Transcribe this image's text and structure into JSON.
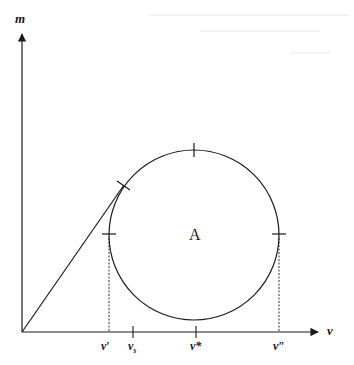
{
  "figure": {
    "colors": {
      "ink": "#1a1a1a",
      "background": "#ffffff"
    },
    "axes": {
      "y_label": "m",
      "x_label": "ν",
      "origin": [
        22,
        332
      ],
      "y_end": [
        22,
        32
      ],
      "x_end": [
        320,
        332
      ]
    },
    "circle": {
      "label": "A",
      "center": [
        194,
        235
      ],
      "radius": 85
    },
    "tangent_line": {
      "from": [
        22,
        332
      ],
      "to": [
        123,
        186
      ]
    },
    "ticks": {
      "v_prime": {
        "label": "ν′",
        "x": 108
      },
      "v_s": {
        "label": "ν",
        "sub": "s",
        "x": 133
      },
      "v_star": {
        "label": "ν*",
        "x": 196
      },
      "v_double_prime": {
        "label": "ν″",
        "x": 279
      }
    }
  }
}
